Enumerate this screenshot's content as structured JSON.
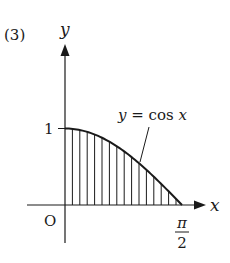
{
  "problem_number": "(3)",
  "axes": {
    "x_label": "x",
    "y_label": "y",
    "origin_label": "O"
  },
  "ticks": {
    "y_tick_label": "1",
    "x_tick_numerator": "π",
    "x_tick_denominator": "2"
  },
  "curve": {
    "label": "y = cos x",
    "function": "cos x",
    "domain": [
      "0",
      "π/2"
    ],
    "shaded_region": "area under y = cos x from 0 to π/2 (vertical hatching)"
  },
  "colors": {
    "ink": "#1a1a1a",
    "background": "#ffffff"
  }
}
